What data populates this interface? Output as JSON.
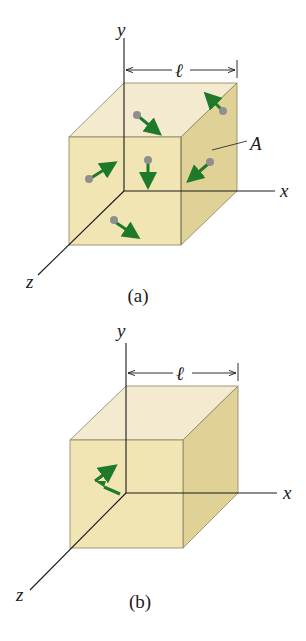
{
  "figure": {
    "colors": {
      "cube_face": "#efe3ac",
      "cube_side": "#e0d197",
      "cube_top": "#f3ead0",
      "edge": "#8a8260",
      "axis": "#1a1a1a",
      "arrow": "#1e7a2a",
      "molecule": "#8f8f8f"
    },
    "panels": [
      {
        "id": "a",
        "caption": "(a)",
        "axis_labels": {
          "x": "x",
          "y": "y",
          "z": "z"
        },
        "dimension_label": "ℓ",
        "face_label": "A",
        "description": "Cube containing many gas molecules moving in random directions",
        "molecule_count": 7
      },
      {
        "id": "b",
        "caption": "(b)",
        "axis_labels": {
          "x": "x",
          "y": "y",
          "z": "z"
        },
        "dimension_label": "ℓ",
        "description": "Single molecule colliding with the wall, velocity reversed",
        "molecule_count": 1
      }
    ]
  }
}
